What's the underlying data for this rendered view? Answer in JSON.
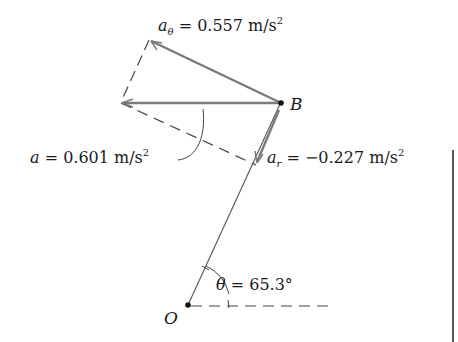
{
  "diagram": {
    "type": "vector-acceleration-diagram",
    "points": {
      "B": {
        "label": "B"
      },
      "O": {
        "label": "O"
      }
    },
    "vectors": {
      "a_theta": {
        "symbol": "a",
        "subscript": "θ",
        "equals": " = 0.557 m/s",
        "exponent": "2",
        "value": 0.557,
        "unit": "m/s²"
      },
      "a": {
        "symbol": "a",
        "equals": " = 0.601 m/s",
        "exponent": "2",
        "value": 0.601,
        "unit": "m/s²"
      },
      "a_r": {
        "symbol": "a",
        "subscript": "r",
        "equals": " = −0.227 m/s",
        "exponent": "2",
        "value": -0.227,
        "unit": "m/s²"
      }
    },
    "angle": {
      "symbol": "θ",
      "equals": " = 65.3°",
      "value": 65.3,
      "unit": "°"
    },
    "colors": {
      "vector": "#7a7a7a",
      "line": "#555555",
      "dashed": "#444444",
      "text": "#1a1a1a",
      "border": "#222222"
    }
  }
}
